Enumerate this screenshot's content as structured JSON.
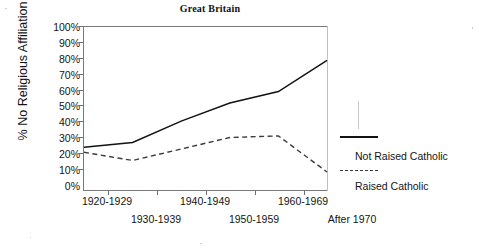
{
  "chart_data": {
    "type": "line",
    "title": "Great Britain",
    "xlabel": "",
    "ylabel": "% No Religious Affiliation",
    "categories": [
      "1920-1929",
      "1930-1939",
      "1940-1949",
      "1950-1959",
      "1960-1969",
      "After 1970"
    ],
    "series": [
      {
        "name": "Not Raised Catholic",
        "style": "solid",
        "values": [
          26,
          29,
          42,
          53,
          60,
          79
        ]
      },
      {
        "name": "Raised Catholic",
        "style": "dashed",
        "values": [
          23,
          18,
          25,
          32,
          33,
          11
        ]
      }
    ],
    "ylim": [
      0,
      100
    ],
    "ytick_labels": [
      "100%",
      "90%",
      "80%",
      "70%",
      "60%",
      "50%",
      "40%",
      "30%",
      "20%",
      "10%",
      "0%"
    ],
    "ytick_values": [
      100,
      90,
      80,
      70,
      60,
      50,
      40,
      30,
      20,
      10,
      0
    ],
    "grid": false,
    "legend_position": "right",
    "legend_entries": [
      {
        "label": "Not Raised Catholic",
        "style": "solid"
      },
      {
        "label": "Raised Catholic",
        "style": "dashed"
      }
    ],
    "colors": {
      "series_not_raised_catholic": "#121212",
      "series_raised_catholic": "#3a3a3a",
      "axis": "#7a7a7a",
      "text": "#141414",
      "background": "#ffffff"
    }
  }
}
